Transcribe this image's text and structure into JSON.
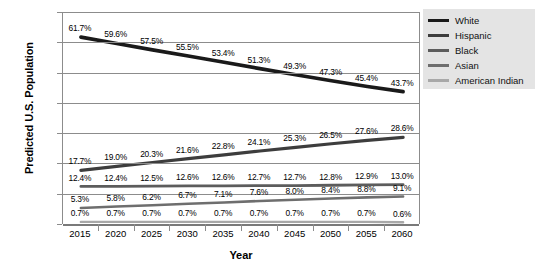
{
  "chart_data": {
    "type": "line",
    "title": "",
    "xlabel": "Year",
    "ylabel": "Predicted U.S. Population",
    "x": [
      2015,
      2020,
      2025,
      2030,
      2035,
      2040,
      2045,
      2050,
      2055,
      2060
    ],
    "categories": [
      "2015",
      "2020",
      "2025",
      "2030",
      "2035",
      "2040",
      "2045",
      "2050",
      "2055",
      "2060"
    ],
    "ylim": [
      0,
      70
    ],
    "yticks": [
      "0.0%",
      "10.0%",
      "20.0%",
      "30.0%",
      "40.0%",
      "50.0%",
      "60.0%",
      "70.0%"
    ],
    "ytick_values": [
      0,
      10,
      20,
      30,
      40,
      50,
      60,
      70
    ],
    "grid": true,
    "legend_position": "right",
    "series": [
      {
        "name": "White",
        "color": "#1a1a1a",
        "values": [
          61.7,
          59.6,
          57.5,
          55.5,
          53.4,
          51.3,
          49.3,
          47.3,
          45.4,
          43.7
        ],
        "labels": [
          "61.7%",
          "59.6%",
          "57.5%",
          "55.5%",
          "53.4%",
          "51.3%",
          "49.3%",
          "47.3%",
          "45.4%",
          "43.7%"
        ]
      },
      {
        "name": "Hispanic",
        "color": "#3d3d3d",
        "values": [
          17.7,
          19.0,
          20.3,
          21.6,
          22.8,
          24.1,
          25.3,
          26.5,
          27.6,
          28.6
        ],
        "labels": [
          "17.7%",
          "19.0%",
          "20.3%",
          "21.6%",
          "22.8%",
          "24.1%",
          "25.3%",
          "26.5%",
          "27.6%",
          "28.6%"
        ]
      },
      {
        "name": "Black",
        "color": "#5c5c5c",
        "values": [
          12.4,
          12.4,
          12.5,
          12.6,
          12.6,
          12.7,
          12.7,
          12.8,
          12.9,
          13.0
        ],
        "labels": [
          "12.4%",
          "12.4%",
          "12.5%",
          "12.6%",
          "12.6%",
          "12.7%",
          "12.7%",
          "12.8%",
          "12.9%",
          "13.0%"
        ]
      },
      {
        "name": "Asian",
        "color": "#6e6e6e",
        "values": [
          5.3,
          5.8,
          6.2,
          6.7,
          7.1,
          7.6,
          8.0,
          8.4,
          8.8,
          9.1
        ],
        "labels": [
          "5.3%",
          "5.8%",
          "6.2%",
          "6.7%",
          "7.1%",
          "7.6%",
          "8.0%",
          "8.4%",
          "8.8%",
          "9.1%"
        ]
      },
      {
        "name": "American Indian",
        "color": "#a8a8a8",
        "values": [
          0.7,
          0.7,
          0.7,
          0.7,
          0.7,
          0.7,
          0.7,
          0.7,
          0.7,
          0.6
        ],
        "labels": [
          "0.7%",
          "0.7%",
          "0.7%",
          "0.7%",
          "0.7%",
          "0.7%",
          "0.7%",
          "0.7%",
          "0.7%",
          "0.6%"
        ]
      }
    ]
  },
  "legend": {
    "background": "#e4e4e4",
    "items": [
      {
        "label": "White",
        "color": "#1a1a1a"
      },
      {
        "label": "Hispanic",
        "color": "#3d3d3d"
      },
      {
        "label": "Black",
        "color": "#5c5c5c"
      },
      {
        "label": "Asian",
        "color": "#6e6e6e"
      },
      {
        "label": "American Indian",
        "color": "#a8a8a8"
      }
    ]
  },
  "axes": {
    "grid_color": "#8c8c8c",
    "baseline_color": "#7a7a7a"
  }
}
